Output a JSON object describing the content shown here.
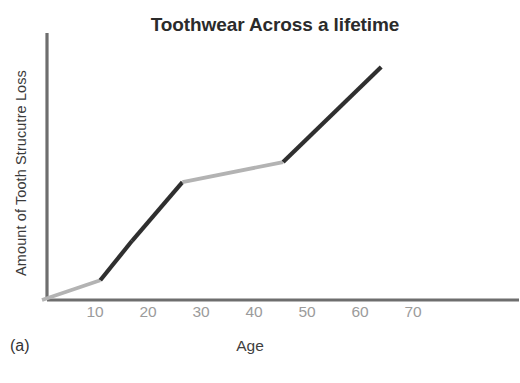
{
  "figure": {
    "panel_label": "(a)",
    "background_color": "#ffffff"
  },
  "chart_data": {
    "type": "line",
    "title": "Toothwear Across a lifetime",
    "xlabel": "Age",
    "ylabel": "Amount of Tooth Strucutre Loss",
    "xlim": [
      0,
      80
    ],
    "ylim": [
      0,
      100
    ],
    "grid": false,
    "legend": null,
    "xticks": [
      10,
      20,
      30,
      40,
      50,
      60,
      70
    ],
    "xtick_labels": [
      "10",
      "20",
      "30",
      "40",
      "50",
      "60",
      "70"
    ],
    "yticks": [],
    "ytick_labels": [],
    "axis_color": "#6e6e6e",
    "tick_label_color": "#9b9b9b",
    "title_color": "#2b2b2b",
    "colors": {
      "dark_segment": "#2f2f2f",
      "light_segment": "#b3b3b3"
    },
    "x": [
      0,
      11,
      17,
      26.5,
      45.5,
      64
    ],
    "y": [
      0,
      7.4,
      22.2,
      44.2,
      51.7,
      87.4
    ],
    "series": [
      {
        "name": "Tooth structure loss",
        "x": [
          0,
          11,
          17,
          26.5,
          45.5,
          64
        ],
        "values": [
          0,
          7.4,
          22.2,
          44.2,
          51.7,
          87.4
        ]
      }
    ],
    "segments": [
      {
        "name": "childhood-slow-wear",
        "x0": 0,
        "y0": 0,
        "x1": 11,
        "y1": 7.4,
        "color": "#b3b3b3",
        "shade": "light"
      },
      {
        "name": "adolescent-wear",
        "x0": 11,
        "y0": 7.4,
        "x1": 17,
        "y1": 22.2,
        "color": "#2f2f2f",
        "shade": "dark"
      },
      {
        "name": "young-adult-rapid-wear",
        "x0": 17,
        "y0": 22.2,
        "x1": 26.5,
        "y1": 44.2,
        "color": "#2f2f2f",
        "shade": "dark"
      },
      {
        "name": "midlife-plateau",
        "x0": 26.5,
        "y0": 44.2,
        "x1": 45.5,
        "y1": 51.7,
        "color": "#b3b3b3",
        "shade": "light"
      },
      {
        "name": "late-life-rapid-wear",
        "x0": 45.5,
        "y0": 51.7,
        "x1": 64,
        "y1": 87.4,
        "color": "#2f2f2f",
        "shade": "dark"
      }
    ]
  }
}
